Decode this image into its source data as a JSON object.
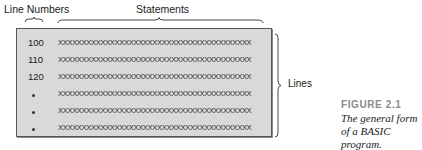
{
  "diagram": {
    "labels": {
      "line_numbers": "Line Numbers",
      "statements": "Statements",
      "lines": "Lines"
    },
    "rows": [
      {
        "number": "100",
        "statement": "XXXXXXXXXXXXXXXXXXXXXXXXXXXXXXXXXXXXXXXXX",
        "marker": ""
      },
      {
        "number": "110",
        "statement": "XXXXXXXXXXXXXXXXXXXXXXXXXXXXXXXXXXXXXXXXX",
        "marker": ""
      },
      {
        "number": "120",
        "statement": "XXXXXXXXXXXXXXXXXXXXXXXXXXXXXXXXXXXXXXXXX",
        "marker": ""
      },
      {
        "number": "",
        "statement": "XXXXXXXXXXXXXXXXXXXXXXXXXXXXXXXXXXXXXXXXX",
        "marker": "dot"
      },
      {
        "number": "",
        "statement": "XXXXXXXXXXXXXXXXXXXXXXXXXXXXXXXXXXXXXXXXX",
        "marker": "dot"
      },
      {
        "number": "",
        "statement": "XXXXXXXXXXXXXXXXXXXXXXXXXXXXXXXXXXXXXXXXX",
        "marker": "dot"
      }
    ],
    "box_color": "#d9d9d9"
  },
  "caption": {
    "figure_number": "FIGURE 2.1",
    "text": "The general form of a BASIC program."
  }
}
